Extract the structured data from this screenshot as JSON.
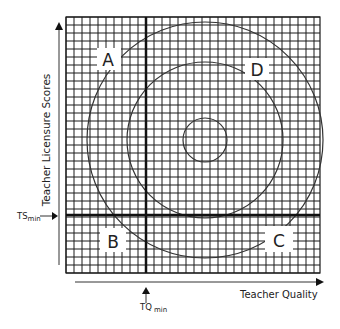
{
  "diagram": {
    "y_axis_label": "Teacher Licensure Scores",
    "x_axis_label": "Teacher Quality",
    "ts_min_label": "TS",
    "ts_min_sub": "min",
    "tq_min_label": "TQ",
    "tq_min_sub": "min",
    "quadrants": {
      "top_left": "A",
      "bottom_left": "B",
      "bottom_right": "C",
      "top_right": "D"
    },
    "colors": {
      "grid": "#1a1a1a",
      "background": "#ffffff",
      "text": "#222222"
    }
  }
}
